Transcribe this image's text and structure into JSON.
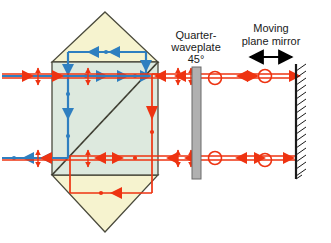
{
  "figure": {
    "background": "#ffffff"
  },
  "labels": {
    "waveplate": {
      "line1": "Quarter-",
      "line2": "waveplate",
      "line3": "45°"
    },
    "mirror": {
      "line1": "Moving",
      "line2": "plane mirror"
    }
  },
  "colors": {
    "red_beam": "#ee3311",
    "blue_beam": "#2f7fc0",
    "prism_outline": "#4a4a3c",
    "prism_top_fill": "#f6f3cf",
    "prism_body_fill": "#dde9de",
    "prism_bottom_fill": "#f6f3cf",
    "waveplate_fill": "#b0b0b0",
    "waveplate_stroke": "#6a6a6a",
    "mirror_stroke": "#1a1a1a",
    "label_text": "#1a1a1a",
    "motion_arrow": "#000000"
  },
  "components": {
    "prism": {
      "name": "polarizing-beam-splitter-prism",
      "apex_top": [
        105,
        12
      ],
      "apex_bottom": [
        105,
        232
      ],
      "body_left": 52,
      "body_right": 158,
      "body_top": 62,
      "body_bottom": 175,
      "diagonal": "bottom-left to top-right"
    },
    "waveplate": {
      "name": "quarter-waveplate",
      "x": 192,
      "y": 67,
      "width": 9,
      "height": 112,
      "angle_deg": 45
    },
    "mirror": {
      "name": "moving-plane-mirror",
      "x": 296,
      "y": 64,
      "height": 115,
      "hatch_side": "right",
      "hatch_count": 16
    },
    "motion_arrow": {
      "name": "mirror-motion-arrow",
      "x1": 248,
      "x2": 292,
      "y": 57
    }
  },
  "beams": {
    "upper_input_output": {
      "y": 76,
      "x_from": 2,
      "x_to": 52
    },
    "lower_input_output": {
      "y": 158,
      "x_from": 2,
      "x_to": 52
    },
    "upper_right": {
      "y": 78,
      "x_from": 158,
      "x_to": 296
    },
    "lower_right": {
      "y": 160,
      "x_from": 158,
      "x_to": 296
    },
    "blue_loop_top_y": 52,
    "red_loop_bottom_y": 193,
    "blue_vertical_left_x": 68,
    "blue_vertical_right_x": 146,
    "red_vertical_x": 152,
    "red_loop_left_x": 70,
    "red_loop_right_x": 152
  },
  "polarization_markers": {
    "linear_vertical": "double-headed vertical arrow (s-polarization)",
    "circular": "open circle (circular polarization)",
    "count_linear": 8,
    "count_circular": 4
  }
}
